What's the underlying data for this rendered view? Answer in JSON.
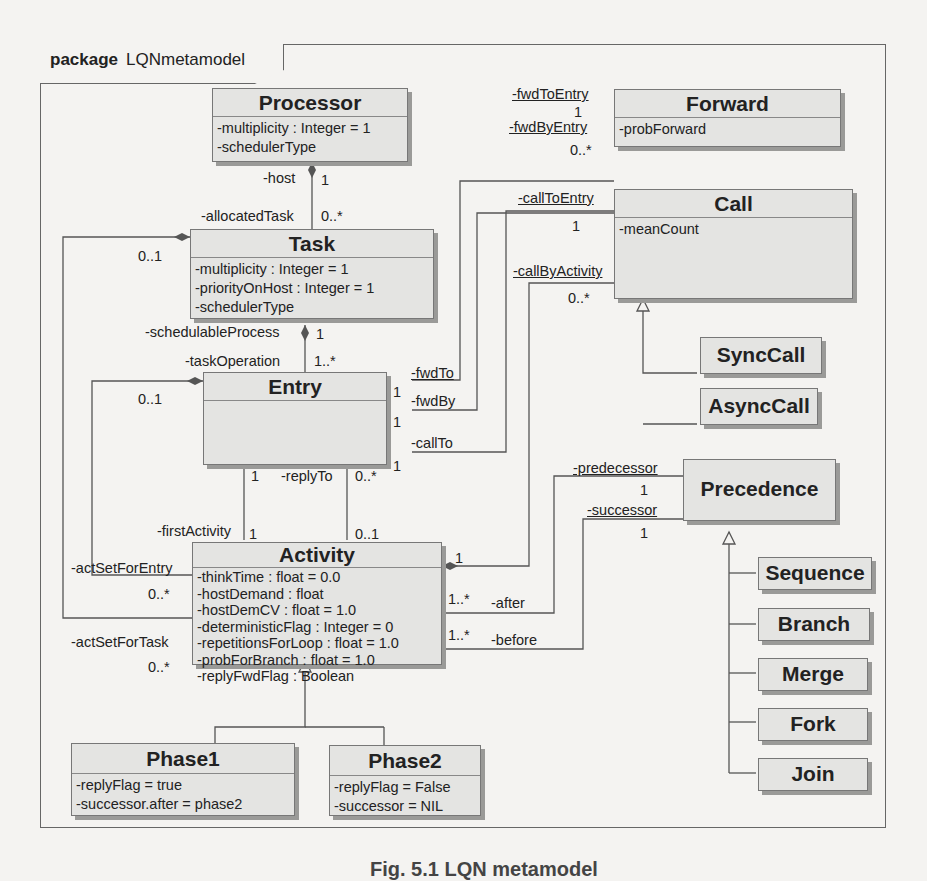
{
  "package": {
    "keyword": "package",
    "name": "LQNmetamodel"
  },
  "classes": {
    "processor": {
      "name": "Processor",
      "attrs": [
        "-multiplicity : Integer = 1",
        "-schedulerType"
      ]
    },
    "forward": {
      "name": "Forward",
      "attrs": [
        "-probForward"
      ]
    },
    "call": {
      "name": "Call",
      "attrs": [
        "-meanCount"
      ]
    },
    "task": {
      "name": "Task",
      "attrs": [
        "-multiplicity : Integer = 1",
        "-priorityOnHost : Integer = 1",
        "-schedulerType"
      ]
    },
    "entry": {
      "name": "Entry",
      "attrs": []
    },
    "synccall": {
      "name": "SyncCall"
    },
    "asynccall": {
      "name": "AsyncCall"
    },
    "precedence": {
      "name": "Precedence"
    },
    "activity": {
      "name": "Activity",
      "attrs": [
        "-thinkTime : float = 0.0",
        "-hostDemand : float",
        "-hostDemCV : float = 1.0",
        "-deterministicFlag : Integer = 0",
        "-repetitionsForLoop : float = 1.0",
        "-probForBranch : float = 1.0",
        "-replyFwdFlag : Boolean"
      ]
    },
    "sequence": {
      "name": "Sequence"
    },
    "branch": {
      "name": "Branch"
    },
    "merge": {
      "name": "Merge"
    },
    "fork": {
      "name": "Fork"
    },
    "join": {
      "name": "Join"
    },
    "phase1": {
      "name": "Phase1",
      "attrs": [
        "-replyFlag = true",
        "-successor.after = phase2"
      ]
    },
    "phase2": {
      "name": "Phase2",
      "attrs": [
        "-replyFlag = False",
        "-successor = NIL"
      ]
    }
  },
  "roles": {
    "host": "-host",
    "host_mult": "1",
    "allocatedTask": "-allocatedTask",
    "allocatedTask_mult": "0..*",
    "fwdToEntry": "-fwdToEntry",
    "fwdToEntry_mult": "1",
    "fwdByEntry": "-fwdByEntry",
    "fwdByEntry_mult": "0..*",
    "callToEntry": "-callToEntry",
    "callToEntry_mult": "1",
    "callByActivity": "-callByActivity",
    "callByActivity_mult": "0..*",
    "task_left_mult": "0..1",
    "schedulableProcess": "-schedulableProcess",
    "schedulableProcess_mult": "1",
    "taskOperation": "-taskOperation",
    "taskOperation_mult": "1..*",
    "entry_left_mult": "0..1",
    "fwdTo": "-fwdTo",
    "fwdTo_mult": "1",
    "fwdBy": "-fwdBy",
    "fwdBy_mult": "1",
    "callTo": "-callTo",
    "callTo_mult": "1",
    "replyTo": "-replyTo",
    "replyTo_top_left": "1",
    "replyTo_top_right": "0..*",
    "firstActivity": "-firstActivity",
    "firstActivity_mult": "1",
    "replyTo_bottom": "0..1",
    "actSetForEntry": "-actSetForEntry",
    "actSetForEntry_mult": "0..*",
    "actSetForTask": "-actSetForTask",
    "actSetForTask_mult": "0..*",
    "predecessor": "-predecessor",
    "predecessor_mult": "1",
    "successor": "-successor",
    "successor_mult": "1",
    "activity_call_mult": "1",
    "after": "-after",
    "after_mult": "1..*",
    "before": "-before",
    "before_mult": "1..*"
  },
  "caption": "Fig. 5.1 LQN metamodel"
}
